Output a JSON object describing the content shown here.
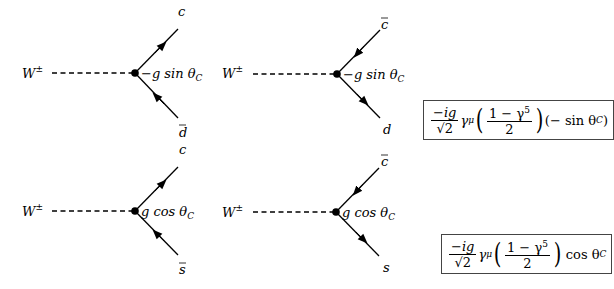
{
  "diagrams": [
    {
      "boson_label": "W",
      "boson_charge": "±",
      "coupling_prefix": "−g sin θ",
      "coupling_sub": "C",
      "top_fermion": "c",
      "top_bar": false,
      "bottom_fermion": "d",
      "bottom_bar": true,
      "top_arrow": "outgoing",
      "bottom_arrow": "incoming"
    },
    {
      "boson_label": "W",
      "boson_charge": "±",
      "coupling_prefix": "−g sin θ",
      "coupling_sub": "C",
      "top_fermion": "c",
      "top_bar": true,
      "bottom_fermion": "d",
      "bottom_bar": false,
      "top_arrow": "incoming",
      "bottom_arrow": "outgoing"
    },
    {
      "boson_label": "W",
      "boson_charge": "±",
      "coupling_prefix": "g cos θ",
      "coupling_sub": "C",
      "top_fermion": "c",
      "top_bar": false,
      "bottom_fermion": "s",
      "bottom_bar": true,
      "top_arrow": "outgoing",
      "bottom_arrow": "incoming"
    },
    {
      "boson_label": "W",
      "boson_charge": "±",
      "coupling_prefix": "g cos θ",
      "coupling_sub": "C",
      "top_fermion": "c",
      "top_bar": true,
      "bottom_fermion": "s",
      "bottom_bar": false,
      "top_arrow": "incoming",
      "bottom_arrow": "outgoing"
    }
  ],
  "formulas": [
    {
      "num": "−ig",
      "den": "√2",
      "gamma": "γ",
      "gamma_sup": "μ",
      "inner_num": "1 − γ",
      "inner_sup": "5",
      "inner_den": "2",
      "factor": "(− sin θ",
      "factor_sub": "C",
      "factor_close": ")"
    },
    {
      "num": "−ig",
      "den": "√2",
      "gamma": "γ",
      "gamma_sup": "μ",
      "inner_num": "1 − γ",
      "inner_sup": "5",
      "inner_den": "2",
      "factor": "cos θ",
      "factor_sub": "C",
      "factor_close": ""
    }
  ]
}
